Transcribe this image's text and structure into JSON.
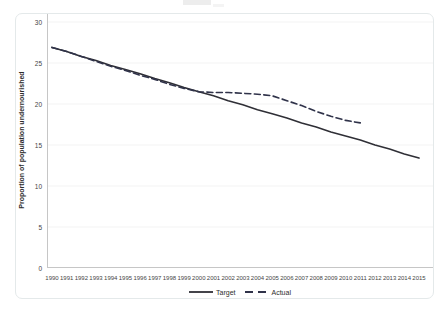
{
  "figure": {
    "ylabel": "Proportion of population undernourished",
    "line_color": "#2f2f36",
    "dashed_color": "#30334a",
    "axis_color": "#c6c6c6",
    "grid_color": "#f3f3f3"
  },
  "legend": {
    "items": [
      {
        "label": "Target",
        "style": "solid"
      },
      {
        "label": "Actual",
        "style": "dashed"
      }
    ]
  },
  "chart_data": {
    "type": "line",
    "title": "",
    "xlabel": "",
    "ylabel": "Proportion of population undernourished",
    "ylim": [
      0,
      30
    ],
    "y_ticks": [
      0,
      5,
      10,
      15,
      20,
      25,
      30
    ],
    "x_ticks": [
      1990,
      1991,
      1992,
      1993,
      1994,
      1995,
      1996,
      1997,
      1998,
      1999,
      2000,
      2001,
      2002,
      2003,
      2004,
      2005,
      2006,
      2007,
      2008,
      2009,
      2010,
      2011,
      2012,
      2013,
      2014,
      2015
    ],
    "grid": true,
    "legend_position": "bottom-center",
    "series": [
      {
        "name": "Target",
        "line_style": "solid",
        "color": "#2f2f36",
        "x": [
          1990,
          1991,
          1992,
          1993,
          1994,
          1995,
          1996,
          1997,
          1998,
          1999,
          2000,
          2001,
          2002,
          2003,
          2004,
          2005,
          2006,
          2007,
          2008,
          2009,
          2010,
          2011,
          2012,
          2013,
          2014,
          2015
        ],
        "values": [
          26.9,
          26.4,
          25.8,
          25.3,
          24.7,
          24.2,
          23.7,
          23.1,
          22.6,
          22.0,
          21.5,
          21.0,
          20.4,
          19.9,
          19.3,
          18.8,
          18.3,
          17.7,
          17.2,
          16.6,
          16.1,
          15.6,
          15.0,
          14.5,
          13.9,
          13.4
        ]
      },
      {
        "name": "Actual",
        "line_style": "dashed",
        "color": "#30334a",
        "x": [
          1990,
          1991,
          1992,
          1993,
          1994,
          1995,
          1996,
          1997,
          1998,
          1999,
          2000,
          2001,
          2002,
          2003,
          2004,
          2005,
          2006,
          2007,
          2008,
          2009,
          2010,
          2011
        ],
        "values": [
          26.9,
          26.4,
          25.8,
          25.2,
          24.6,
          24.1,
          23.5,
          23.0,
          22.4,
          21.9,
          21.5,
          21.4,
          21.4,
          21.3,
          21.2,
          21.0,
          20.4,
          19.8,
          19.1,
          18.5,
          18.0,
          17.7
        ]
      }
    ]
  }
}
